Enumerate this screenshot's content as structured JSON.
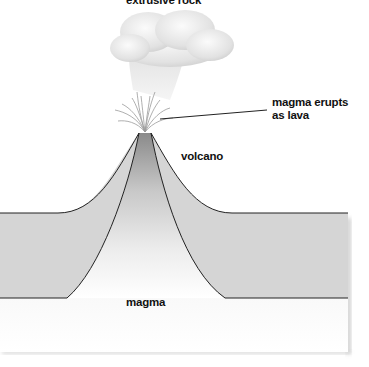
{
  "diagram": {
    "type": "volcano cross-section",
    "labels": {
      "top": "extrusive rock",
      "eruption_line1": "magma erupts",
      "eruption_line2": "as lava",
      "volcano": "volcano",
      "magma": "magma"
    },
    "colors": {
      "crust": "#d4d4d4",
      "conduit_dark": "#8c8c8c",
      "magma_light": "#f4f4f4",
      "outline": "#222222",
      "cloud": "#e6e6e6"
    }
  }
}
